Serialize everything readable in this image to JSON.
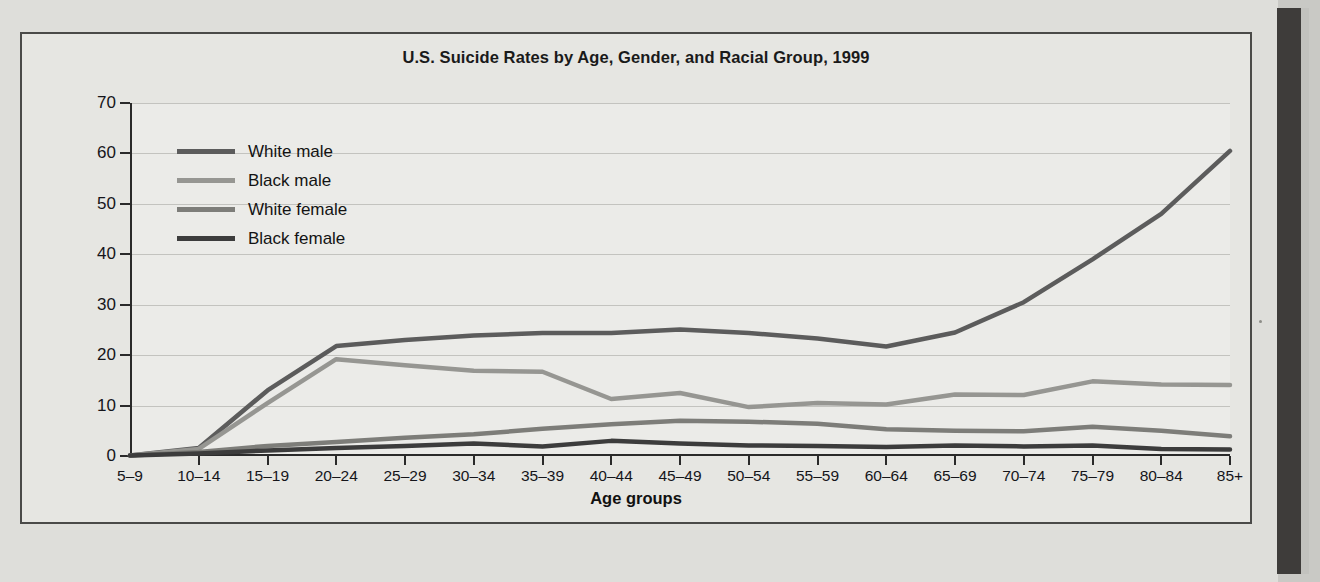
{
  "figure": {
    "title": "U.S. Suicide Rates by Age, Gender, and Racial Group, 1999",
    "x_axis_name": "Age groups",
    "y_axis_name": "Suicide rate per 100,000"
  },
  "legend": {
    "items": [
      {
        "label": "White male",
        "color": "#5c5c5c"
      },
      {
        "label": "Black male",
        "color": "#969692"
      },
      {
        "label": "White female",
        "color": "#7d7d79"
      },
      {
        "label": "Black female",
        "color": "#3c3c3c"
      }
    ]
  },
  "colors": {
    "panel_background": "#e6e6e2",
    "plot_background": "#ebebe8",
    "gridline": "#c3c3bf",
    "axis": "#2a2a2a",
    "page": "#dededa",
    "gutter": "#3e3c3a"
  },
  "chart_data": {
    "type": "line",
    "title": "U.S. Suicide Rates by Age, Gender, and Racial Group, 1999",
    "xlabel": "Age groups",
    "ylabel": "Suicide rate per 100,000",
    "ylim": [
      0,
      70
    ],
    "yticks": [
      0,
      10,
      20,
      30,
      40,
      50,
      60,
      70
    ],
    "grid": true,
    "legend_position": "upper-left-inside",
    "categories": [
      "5–9",
      "10–14",
      "15–19",
      "20–24",
      "25–29",
      "30–34",
      "35–39",
      "40–44",
      "45–49",
      "50–54",
      "55–59",
      "60–64",
      "65–69",
      "70–74",
      "75–79",
      "80–84",
      "85+"
    ],
    "series": [
      {
        "name": "White male",
        "color": "#5c5c5c",
        "values": [
          0.1,
          1.6,
          13.0,
          21.8,
          23.0,
          23.9,
          24.4,
          24.4,
          25.1,
          24.4,
          23.3,
          21.7,
          24.5,
          30.5,
          39.0,
          48.0,
          60.5
        ]
      },
      {
        "name": "Black male",
        "color": "#969692",
        "values": [
          0.1,
          1.4,
          10.5,
          19.2,
          18.0,
          16.9,
          16.7,
          11.3,
          12.5,
          9.7,
          10.5,
          10.2,
          12.2,
          12.1,
          14.8,
          14.2,
          14.1
        ]
      },
      {
        "name": "White female",
        "color": "#7d7d79",
        "values": [
          0.1,
          0.8,
          2.0,
          2.8,
          3.6,
          4.3,
          5.4,
          6.3,
          7.0,
          6.8,
          6.4,
          5.3,
          5.0,
          4.9,
          5.8,
          5.0,
          3.9
        ]
      },
      {
        "name": "Black female",
        "color": "#3c3c3c",
        "values": [
          0.1,
          0.5,
          1.1,
          1.6,
          2.0,
          2.5,
          1.9,
          3.0,
          2.5,
          2.1,
          2.0,
          1.8,
          2.1,
          1.9,
          2.1,
          1.4,
          1.3
        ]
      }
    ]
  }
}
